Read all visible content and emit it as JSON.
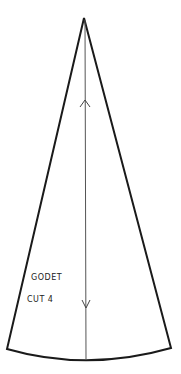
{
  "pattern": {
    "piece_name": "GODET",
    "cut_instruction": "CUT 4",
    "shape": "godet-wedge",
    "colors": {
      "background": "#ffffff",
      "outline": "#1a1a1a",
      "grainline": "#555555",
      "text": "#222222"
    },
    "geometry": {
      "apex": [
        84,
        18
      ],
      "bottom_left": [
        7,
        349
      ],
      "bottom_right": [
        171,
        348
      ],
      "hem_curve_lowest": [
        87,
        360
      ],
      "grainline": {
        "x": 85,
        "y_start": 18,
        "y_end": 360
      },
      "arrow_up_y": 100,
      "arrow_down_y": 305
    }
  }
}
